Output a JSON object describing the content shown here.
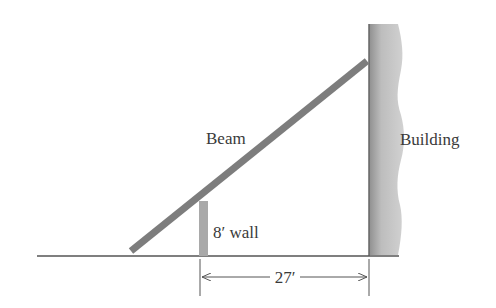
{
  "diagram": {
    "labels": {
      "beam": "Beam",
      "building": "Building",
      "wall": "8′ wall",
      "distance": "27′"
    },
    "colors": {
      "beam": "#7d7d7d",
      "wall": "#a9a9a9",
      "building_light": "#c4c4c4",
      "building_dark": "#8a8a8a",
      "ground": "#555555",
      "text": "#3a3a3a"
    }
  }
}
